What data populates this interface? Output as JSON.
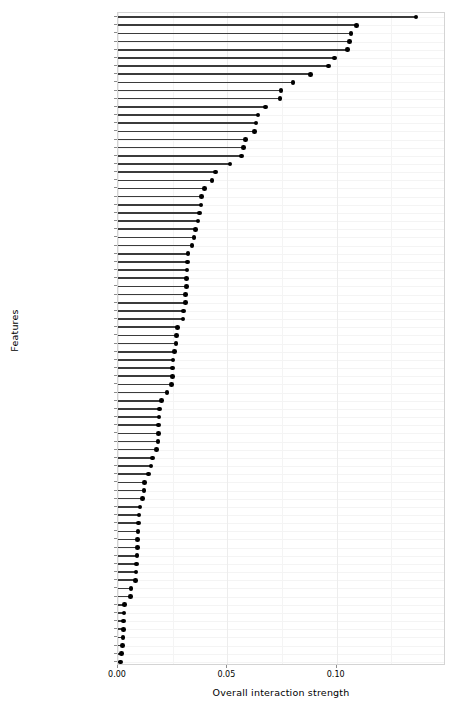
{
  "chart_data": {
    "type": "bar",
    "subtype": "lollipop-dot-plot",
    "title": "",
    "xlabel": "Overall interaction strength",
    "ylabel": "Features",
    "xlim": [
      0,
      0.15
    ],
    "xticks": [
      0.0,
      0.05,
      0.1
    ],
    "xtick_labels": [
      "0.00",
      "0.05",
      "0.10"
    ],
    "grid": true,
    "legend": null,
    "orientation": "horizontal",
    "sorted": "descending",
    "categories": [
      "First_Flr_SF",
      "Overall_Qual",
      "Kitchen_Qual",
      "Second_Flr_SF",
      "Lot_Area",
      "Gr_Liv_Area",
      "Bsmt_Exposure",
      "Total_Bsmt_SF",
      "Garage_Cars",
      "Bsmt_Qual",
      "Fireplace_Qu",
      "Longitude",
      "Lot_Frontage",
      "Bsmt_Unf_SF",
      "Year_Built",
      "Neighborhood",
      "Year_Remod_Add",
      "Overall_Cond",
      "BsmtFin_Type_1",
      "Exterior_1st",
      "Exterior_2nd",
      "Exter_Qual",
      "MS_SubClass",
      "Garage_Area",
      "Open_Porch_SF",
      "Bsmt_Full_Bath",
      "Sale_Condition",
      "Mas_Vnr_Area",
      "TotRms_AbvGrd",
      "Lot_Shape",
      "Mo_Sold",
      "Garage_Finish",
      "Mas_Vnr_Type",
      "Fence",
      "Wood_Deck_SF",
      "Latitude",
      "BsmtFin_SF_1",
      "Heating_QC",
      "Condition_1",
      "Fireplaces",
      "Foundation",
      "Sale_Type",
      "Full_Bath",
      "Bedroom_AbvGr",
      "MS_Zoning",
      "Garage_Type",
      "Roof_Style",
      "Year_Sold",
      "Screen_Porch",
      "Paved_Drive",
      "Half_Bath",
      "Bsmt_Half_Bath",
      "Lot_Config",
      "Garage_Cond",
      "Land_Slope",
      "House_Style",
      "Bldg_Type",
      "BsmtFin_SF_2",
      "Three_season_porch",
      "Alley",
      "Bsmt_Cond",
      "Electrical",
      "Exter_Cond",
      "Misc_Feature",
      "Garage_Qual",
      "Misc_Val",
      "BsmtFin_Type_2",
      "Functional",
      "Enclosed_Porch",
      "Land_Contour",
      "Kitchen_AbvGr",
      "Central_Air",
      "Roof_Matl",
      "Low_Qual_Fin_SF",
      "Heating",
      "Pool_Area",
      "Condition_2",
      "Pool_QC",
      "Street",
      "Utilities"
    ],
    "values": [
      0.1362,
      0.1092,
      0.1065,
      0.1058,
      0.105,
      0.099,
      0.0963,
      0.088,
      0.08,
      0.0745,
      0.074,
      0.0675,
      0.064,
      0.0632,
      0.0625,
      0.0584,
      0.0575,
      0.0565,
      0.0512,
      0.0445,
      0.043,
      0.0395,
      0.0383,
      0.038,
      0.0373,
      0.0365,
      0.0355,
      0.0348,
      0.0338,
      0.032,
      0.0318,
      0.0315,
      0.0313,
      0.0312,
      0.031,
      0.0308,
      0.03,
      0.0298,
      0.0272,
      0.0268,
      0.0265,
      0.0258,
      0.0252,
      0.025,
      0.0248,
      0.0245,
      0.0225,
      0.02,
      0.019,
      0.0188,
      0.0186,
      0.0185,
      0.0183,
      0.0175,
      0.0158,
      0.015,
      0.014,
      0.0122,
      0.0118,
      0.0112,
      0.01,
      0.0096,
      0.0094,
      0.0092,
      0.009,
      0.0088,
      0.0086,
      0.0084,
      0.0082,
      0.008,
      0.006,
      0.0058,
      0.003,
      0.0028,
      0.0026,
      0.0024,
      0.0022,
      0.002,
      0.0016,
      0.0012
    ]
  },
  "axis": {
    "x_title": "Overall interaction strength",
    "y_title": "Features"
  }
}
